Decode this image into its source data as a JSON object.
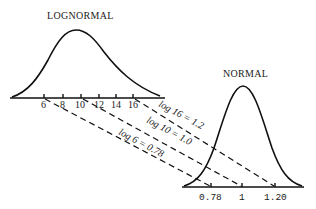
{
  "lognormal": {
    "title": "LOGNORMAL",
    "ticks": [
      {
        "label": "6",
        "x": 44
      },
      {
        "label": "8",
        "x": 63
      },
      {
        "label": "10",
        "x": 81
      },
      {
        "label": "12",
        "x": 99
      },
      {
        "label": "14",
        "x": 116
      },
      {
        "label": "16",
        "x": 133
      }
    ]
  },
  "normal": {
    "title": "NORMAL",
    "ticks": [
      {
        "label": "0.78",
        "x": 211
      },
      {
        "label": "1",
        "x": 242
      },
      {
        "label": "1.20",
        "x": 275
      }
    ]
  },
  "mappings": [
    {
      "from": "6",
      "to": "0.78",
      "label": "log 6 = 0.78"
    },
    {
      "from": "10",
      "to": "1",
      "label": "log 10 = 1.0"
    },
    {
      "from": "16",
      "to": "1.20",
      "label": "log 16 = 1.2"
    }
  ]
}
